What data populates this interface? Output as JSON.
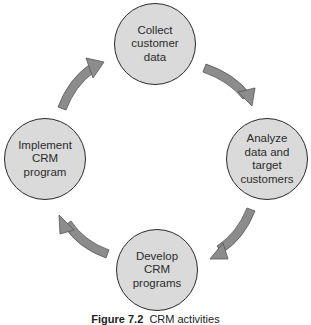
{
  "diagram": {
    "type": "cycle",
    "colors": {
      "node_fill": "#dadada",
      "node_stroke": "#2a2a2a",
      "arrow_fill": "#8c8c8c",
      "arrow_stroke": "#555555",
      "text": "#2b2b2b"
    },
    "nodes": [
      {
        "id": "collect",
        "label": "Collect\ncustomer\ndata",
        "position": "top"
      },
      {
        "id": "analyze",
        "label": "Analyze\ndata and\ntarget\ncustomers",
        "position": "right"
      },
      {
        "id": "develop",
        "label": "Develop\nCRM\nprograms",
        "position": "bottom"
      },
      {
        "id": "implement",
        "label": "Implement\nCRM\nprogram",
        "position": "left"
      }
    ],
    "edges": [
      {
        "from": "collect",
        "to": "analyze"
      },
      {
        "from": "analyze",
        "to": "develop"
      },
      {
        "from": "develop",
        "to": "implement"
      },
      {
        "from": "implement",
        "to": "collect"
      }
    ]
  },
  "caption": {
    "figure_label": "Figure 7.2",
    "text": "CRM activities"
  }
}
